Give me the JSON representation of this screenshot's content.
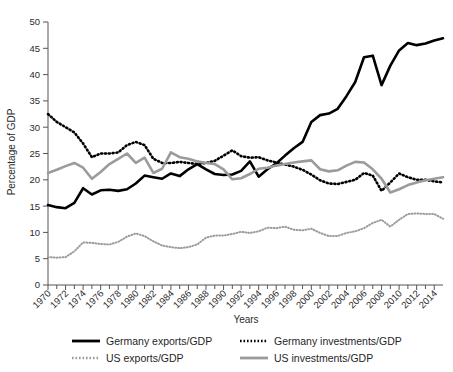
{
  "chart_data": {
    "type": "line",
    "title": "",
    "xlabel": "Years",
    "ylabel": "Percentage of GDP",
    "xlim": [
      1970,
      2015
    ],
    "ylim": [
      0,
      50
    ],
    "yticks": [
      0,
      5,
      10,
      15,
      20,
      25,
      30,
      35,
      40,
      45,
      50
    ],
    "xticks": [
      1970,
      1972,
      1974,
      1976,
      1978,
      1980,
      1982,
      1984,
      1986,
      1988,
      1990,
      1992,
      1994,
      1996,
      1998,
      2000,
      2002,
      2004,
      2006,
      2008,
      2010,
      2012,
      2014
    ],
    "grid": false,
    "legend_position": "bottom",
    "x": [
      1970,
      1971,
      1972,
      1973,
      1974,
      1975,
      1976,
      1977,
      1978,
      1979,
      1980,
      1981,
      1982,
      1983,
      1984,
      1985,
      1986,
      1987,
      1988,
      1989,
      1990,
      1991,
      1992,
      1993,
      1994,
      1995,
      1996,
      1997,
      1998,
      1999,
      2000,
      2001,
      2002,
      2003,
      2004,
      2005,
      2006,
      2007,
      2008,
      2009,
      2010,
      2011,
      2012,
      2013,
      2014,
      2015
    ],
    "series": [
      {
        "name": "Germany exports/GDP",
        "color": "#000000",
        "style": "solid",
        "width": 2.6,
        "values": [
          15.2,
          14.8,
          14.6,
          15.6,
          18.4,
          17.2,
          18.0,
          18.1,
          17.9,
          18.2,
          19.3,
          20.8,
          20.5,
          20.2,
          21.2,
          20.7,
          22.0,
          23.0,
          22.0,
          21.1,
          20.9,
          21.0,
          21.7,
          23.5,
          20.6,
          22.0,
          23.1,
          24.6,
          26.0,
          27.2,
          31.0,
          32.3,
          32.6,
          33.5,
          35.9,
          38.6,
          43.3,
          43.6,
          38.0,
          41.7,
          44.6,
          46.0,
          45.6,
          45.9,
          46.5,
          46.9
        ]
      },
      {
        "name": "Germany investments/GDP",
        "color": "#000000",
        "style": "dotted",
        "width": 2.6,
        "values": [
          32.5,
          31.0,
          30.0,
          29.0,
          26.9,
          24.3,
          25.0,
          25.0,
          25.2,
          26.6,
          27.2,
          26.6,
          24.0,
          23.2,
          23.2,
          23.4,
          23.2,
          23.0,
          23.2,
          23.6,
          24.6,
          25.6,
          24.5,
          24.2,
          24.3,
          23.7,
          23.3,
          22.9,
          22.5,
          21.9,
          21.0,
          19.9,
          19.3,
          19.2,
          19.6,
          20.0,
          21.3,
          20.8,
          17.9,
          19.5,
          21.2,
          20.5,
          20.0,
          20.0,
          19.7,
          19.5
        ]
      },
      {
        "name": "US exports/GDP",
        "color": "#9b9b9b",
        "style": "dotted",
        "width": 2.0,
        "values": [
          5.3,
          5.2,
          5.3,
          6.4,
          8.1,
          8.0,
          7.8,
          7.7,
          8.2,
          9.2,
          9.8,
          9.3,
          8.3,
          7.5,
          7.2,
          7.0,
          7.2,
          7.7,
          9.0,
          9.4,
          9.4,
          9.7,
          10.1,
          9.9,
          10.2,
          10.9,
          10.8,
          11.1,
          10.5,
          10.4,
          10.7,
          9.9,
          9.3,
          9.3,
          9.9,
          10.2,
          10.8,
          11.8,
          12.4,
          11.1,
          12.4,
          13.5,
          13.6,
          13.5,
          13.5,
          12.6
        ]
      },
      {
        "name": "US investments/GDP",
        "color": "#9b9b9b",
        "style": "solid",
        "width": 2.6,
        "values": [
          21.3,
          21.9,
          22.6,
          23.2,
          22.3,
          20.2,
          21.5,
          23.0,
          24.0,
          25.0,
          23.2,
          24.2,
          21.3,
          22.1,
          25.2,
          24.3,
          24.0,
          23.5,
          23.2,
          23.0,
          22.0,
          20.1,
          20.3,
          21.1,
          22.1,
          22.3,
          22.7,
          23.0,
          23.3,
          23.5,
          23.7,
          22.0,
          21.6,
          21.8,
          22.7,
          23.4,
          23.3,
          22.0,
          20.2,
          17.6,
          18.2,
          19.0,
          19.5,
          19.9,
          20.2,
          20.5
        ]
      }
    ]
  },
  "axis": {
    "y_title": "Percentage of GDP",
    "x_title": "Years",
    "y_tick_labels": [
      "50",
      "45",
      "40",
      "35",
      "30",
      "25",
      "20",
      "15",
      "10",
      "5",
      "0"
    ],
    "x_tick_labels": [
      "1970",
      "1972",
      "1974",
      "1976",
      "1978",
      "1980",
      "1982",
      "1984",
      "1986",
      "1988",
      "1990",
      "1992",
      "1994",
      "1996",
      "1998",
      "2000",
      "2002",
      "2004",
      "2006",
      "2008",
      "2010",
      "2012",
      "2014"
    ]
  },
  "legend": {
    "items": [
      {
        "label": "Germany exports/GDP",
        "color": "#000000",
        "style": "solid"
      },
      {
        "label": "Germany investments/GDP",
        "color": "#000000",
        "style": "dotted"
      },
      {
        "label": "US exports/GDP",
        "color": "#9b9b9b",
        "style": "dotted"
      },
      {
        "label": "US investments/GDP",
        "color": "#9b9b9b",
        "style": "solid"
      }
    ]
  }
}
